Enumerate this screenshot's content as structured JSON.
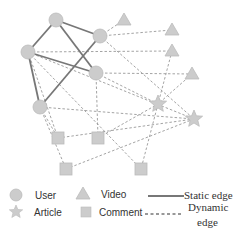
{
  "colors": {
    "node_fill": "#cccccc",
    "node_stroke": "#bbbbbb",
    "static_edge": "#777777",
    "dynamic_edge": "#999999"
  },
  "nodes": [
    {
      "id": "U1",
      "type": "User",
      "x": 56,
      "y": 20
    },
    {
      "id": "U2",
      "type": "User",
      "x": 28,
      "y": 52
    },
    {
      "id": "U3",
      "type": "User",
      "x": 100,
      "y": 36
    },
    {
      "id": "U4",
      "type": "User",
      "x": 96,
      "y": 73
    },
    {
      "id": "U5",
      "type": "User",
      "x": 40,
      "y": 107
    },
    {
      "id": "V1",
      "type": "Video",
      "x": 124,
      "y": 20
    },
    {
      "id": "V2",
      "type": "Video",
      "x": 172,
      "y": 30
    },
    {
      "id": "V3",
      "type": "Video",
      "x": 172,
      "y": 51
    },
    {
      "id": "V4",
      "type": "Video",
      "x": 192,
      "y": 74
    },
    {
      "id": "A1",
      "type": "Article",
      "x": 158,
      "y": 104
    },
    {
      "id": "A2",
      "type": "Article",
      "x": 194,
      "y": 119
    },
    {
      "id": "C1",
      "type": "Comment",
      "x": 58,
      "y": 138
    },
    {
      "id": "C2",
      "type": "Comment",
      "x": 98,
      "y": 138
    },
    {
      "id": "C3",
      "type": "Comment",
      "x": 66,
      "y": 169
    },
    {
      "id": "C4",
      "type": "Comment",
      "x": 141,
      "y": 169
    }
  ],
  "edges": [
    {
      "from": "U1",
      "to": "U2",
      "kind": "static"
    },
    {
      "from": "U1",
      "to": "U3",
      "kind": "static"
    },
    {
      "from": "U1",
      "to": "U4",
      "kind": "static"
    },
    {
      "from": "U2",
      "to": "U4",
      "kind": "static"
    },
    {
      "from": "U2",
      "to": "U5",
      "kind": "static"
    },
    {
      "from": "U3",
      "to": "U5",
      "kind": "static"
    },
    {
      "from": "U3",
      "to": "V1",
      "kind": "dynamic"
    },
    {
      "from": "U3",
      "to": "V2",
      "kind": "dynamic"
    },
    {
      "from": "U2",
      "to": "V3",
      "kind": "dynamic"
    },
    {
      "from": "U4",
      "to": "V4",
      "kind": "dynamic"
    },
    {
      "from": "U4",
      "to": "C2",
      "kind": "dynamic"
    },
    {
      "from": "U4",
      "to": "A1",
      "kind": "dynamic"
    },
    {
      "from": "V3",
      "to": "A1",
      "kind": "dynamic"
    },
    {
      "from": "V4",
      "to": "A1",
      "kind": "dynamic"
    },
    {
      "from": "U2",
      "to": "A2",
      "kind": "dynamic"
    },
    {
      "from": "U2",
      "to": "C4",
      "kind": "dynamic"
    },
    {
      "from": "U2",
      "to": "C1",
      "kind": "dynamic"
    },
    {
      "from": "U5",
      "to": "C1",
      "kind": "dynamic"
    },
    {
      "from": "U5",
      "to": "C3",
      "kind": "dynamic"
    },
    {
      "from": "U5",
      "to": "A2",
      "kind": "dynamic"
    },
    {
      "from": "C1",
      "to": "A2",
      "kind": "dynamic"
    },
    {
      "from": "C3",
      "to": "A2",
      "kind": "dynamic"
    },
    {
      "from": "C2",
      "to": "A1",
      "kind": "dynamic"
    },
    {
      "from": "A1",
      "to": "C4",
      "kind": "dynamic"
    },
    {
      "from": "U3",
      "to": "A2",
      "kind": "dynamic"
    }
  ],
  "legend": {
    "user": "User",
    "video": "Video",
    "static_edge": "Static edge",
    "article": "Article",
    "comment": "Comment",
    "dynamic_edge_line1": "Dynamic",
    "dynamic_edge_line2": "edge"
  }
}
